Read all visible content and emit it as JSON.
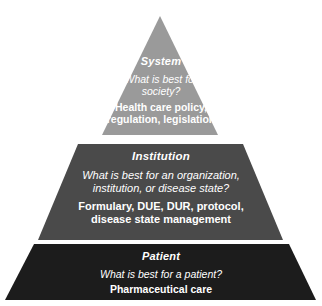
{
  "diagram": {
    "type": "pyramid",
    "orientation": "apex-up",
    "canvas": {
      "width": 322,
      "height": 306,
      "background": "#ffffff"
    },
    "tiers": [
      {
        "id": "system",
        "level": 3,
        "position": "top",
        "heading": "System",
        "question": "What is best for society?",
        "question_lines": [
          "What is best for",
          "society?"
        ],
        "statement": "Health care policy, regulation, legislation",
        "statement_lines": [
          "Health care policy,",
          "regulation, legislation"
        ],
        "fill": "#9a9a9a",
        "text_color": "#ffffff",
        "shape": "triangle",
        "points": "160,16 102,135 218,135"
      },
      {
        "id": "institution",
        "level": 2,
        "position": "middle",
        "heading": "Institution",
        "question": "What is best for an organization, institution, or disease state?",
        "question_lines": [
          "What is best for an organization,",
          "institution, or disease state?"
        ],
        "statement": "Formulary, DUE, DUR, protocol, disease state management",
        "statement_lines": [
          "Formulary, DUE, DUR, protocol,",
          "disease state management"
        ],
        "fill": "#4a4a4a",
        "text_color": "#ffffff",
        "shape": "trapezoid",
        "points": "78,144 243,144 283,240 38,240"
      },
      {
        "id": "patient",
        "level": 1,
        "position": "bottom",
        "heading": "Patient",
        "question": "What is best for a patient?",
        "question_lines": [
          "What is best for a patient?"
        ],
        "statement": "Pharmaceutical care",
        "statement_lines": [
          "Pharmaceutical care"
        ],
        "fill": "#1c1c1c",
        "text_color": "#ffffff",
        "shape": "trapezoid",
        "points": "34,244 289,244 316,300 5,300"
      }
    ]
  }
}
